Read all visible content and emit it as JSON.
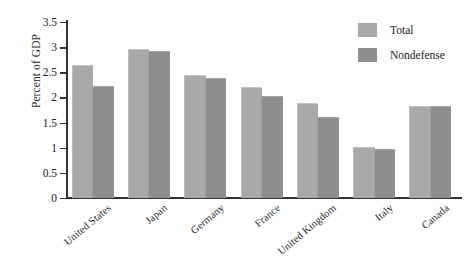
{
  "chart_data": {
    "type": "bar",
    "title": "",
    "subtitle": "",
    "xlabel": "",
    "ylabel": "Percent of GDP",
    "ylim": [
      0,
      3.5
    ],
    "yticks": [
      0,
      0.5,
      1,
      1.5,
      2,
      2.5,
      3,
      3.5
    ],
    "ytick_labels": [
      "0",
      "0.5",
      "1",
      "1.5",
      "2",
      "2.5",
      "3",
      "3.5"
    ],
    "grid": false,
    "legend_position": "top-right",
    "categories": [
      "United States",
      "Japan",
      "Germany",
      "France",
      "United Kingdom",
      "Italy",
      "Canada"
    ],
    "series": [
      {
        "name": "Total",
        "color": "#a9a9a9",
        "values": [
          2.62,
          2.94,
          2.43,
          2.19,
          1.87,
          1.0,
          1.81
        ]
      },
      {
        "name": "Nondefense",
        "color": "#8d8d8d",
        "values": [
          2.21,
          2.9,
          2.37,
          2.01,
          1.59,
          0.96,
          1.81
        ]
      }
    ],
    "annotations": []
  },
  "legend": {
    "items": [
      {
        "label": "Total",
        "color": "#a9a9a9"
      },
      {
        "label": "Nondefense",
        "color": "#8d8d8d"
      }
    ]
  },
  "colors": {
    "total": "#a9a9a9",
    "nondefense": "#8d8d8d",
    "axis": "#333333",
    "text": "#1c1c1c",
    "background": "#ffffff"
  }
}
